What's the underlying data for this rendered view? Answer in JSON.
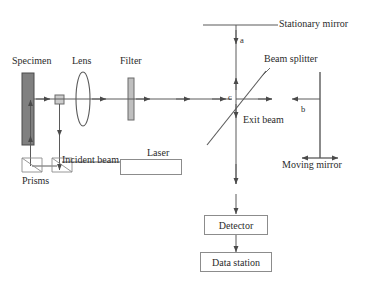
{
  "diagram": {
    "type": "optical-schematic",
    "colors": {
      "line": "#5a5a5a",
      "text": "#2b2b2b",
      "specimen_fill": "#808080",
      "specimen_stroke": "#4a4a4a",
      "filter_fill": "#bfbfbf",
      "filter_stroke": "#6b6b6b",
      "aperture_fill": "#cccccc",
      "box_stroke": "#8c8c8c",
      "background": "#ffffff"
    },
    "labels": {
      "specimen": "Specimen",
      "lens": "Lens",
      "filter": "Filter",
      "stationary_mirror": "Stationary mirror",
      "beam_splitter": "Beam splitter",
      "moving_mirror": "Moving mirror",
      "exit_beam": "Exit beam",
      "incident_beam": "Incident beam",
      "prisms": "Prisms",
      "laser": "Laser",
      "detector": "Detector",
      "data_station": "Data station",
      "path_a": "a",
      "path_b": "b",
      "point_c": "c"
    },
    "components": [
      {
        "name": "specimen",
        "kind": "absorbing-slab",
        "label": "Specimen"
      },
      {
        "name": "aperture",
        "kind": "square-aperture",
        "label": ""
      },
      {
        "name": "lens",
        "kind": "biconvex-lens",
        "label": "Lens"
      },
      {
        "name": "filter",
        "kind": "optical-filter",
        "label": "Filter"
      },
      {
        "name": "beam-splitter",
        "kind": "diagonal-plate",
        "label": "Beam splitter"
      },
      {
        "name": "stationary-mirror",
        "kind": "flat-mirror",
        "label": "Stationary mirror"
      },
      {
        "name": "moving-mirror",
        "kind": "translating-mirror",
        "label": "Moving mirror"
      },
      {
        "name": "prism-left",
        "kind": "right-angle-prism",
        "label": "Prisms"
      },
      {
        "name": "prism-right",
        "kind": "right-angle-prism",
        "label": "Prisms"
      },
      {
        "name": "laser",
        "kind": "source-box",
        "label": "Laser"
      },
      {
        "name": "detector",
        "kind": "instrument-box",
        "label": "Detector"
      },
      {
        "name": "data-station",
        "kind": "instrument-box",
        "label": "Data station"
      }
    ],
    "beam_paths": [
      {
        "name": "main-beam",
        "from": "specimen",
        "to": "beam-splitter",
        "direction": "right"
      },
      {
        "name": "arm-a",
        "from": "beam-splitter",
        "to": "stationary-mirror",
        "direction": "up",
        "marker": "a"
      },
      {
        "name": "arm-b",
        "from": "moving-mirror",
        "to": "beam-splitter",
        "direction": "left",
        "marker": "b"
      },
      {
        "name": "exit-beam",
        "from": "beam-splitter",
        "to": "detector",
        "direction": "down"
      },
      {
        "name": "detector-signal",
        "from": "detector",
        "to": "data-station",
        "direction": "down"
      },
      {
        "name": "laser-reference",
        "from": "laser",
        "to": "prism-right",
        "direction": "left"
      },
      {
        "name": "prism-return",
        "from": "prism-left",
        "to": "specimen",
        "direction": "up"
      }
    ]
  }
}
